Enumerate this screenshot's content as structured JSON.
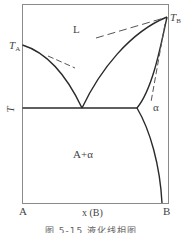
{
  "figure": {
    "caption": "图 5-15   液化线相图",
    "regions": {
      "liquid": "L",
      "two_phase": "A+α",
      "solid_solution": "α"
    },
    "labels": {
      "TA_main": "T",
      "TA_sub": "A",
      "TB_main": "T",
      "TB_sub": "B",
      "y_axis": "T",
      "x_axis": "x (B)",
      "left_end": "A",
      "right_end": "B"
    },
    "colors": {
      "line": "#2a2a2a",
      "frame": "#8a8a8a",
      "dashed": "#555555"
    }
  }
}
